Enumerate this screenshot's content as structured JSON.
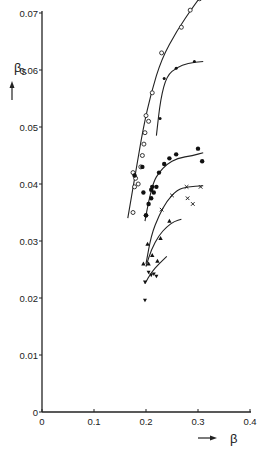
{
  "chart_data": {
    "type": "scatter",
    "title": "",
    "xlabel": "β",
    "ylabel": "βs",
    "xlim": [
      0,
      0.4
    ],
    "ylim": [
      0,
      0.07
    ],
    "x_ticks": [
      "0",
      "0.1",
      "0.2",
      "0.3",
      "0.4"
    ],
    "y_ticks": [
      "0",
      "0.01",
      "0.02",
      "0.03",
      "0.04",
      "0.05",
      "0.06",
      "0.07"
    ],
    "grid": false,
    "legend": "none",
    "series": [
      {
        "name": "open circles",
        "marker": "circle-open",
        "points": [
          [
            0.175,
            0.042
          ],
          [
            0.18,
            0.041
          ],
          [
            0.178,
            0.0395
          ],
          [
            0.185,
            0.04
          ],
          [
            0.19,
            0.043
          ],
          [
            0.193,
            0.045
          ],
          [
            0.196,
            0.047
          ],
          [
            0.198,
            0.049
          ],
          [
            0.2,
            0.052
          ],
          [
            0.205,
            0.051
          ],
          [
            0.212,
            0.056
          ],
          [
            0.23,
            0.063
          ],
          [
            0.268,
            0.0675
          ],
          [
            0.285,
            0.0705
          ],
          [
            0.303,
            0.0725
          ],
          [
            0.175,
            0.035
          ]
        ],
        "curve": [
          [
            0.165,
            0.034
          ],
          [
            0.18,
            0.042
          ],
          [
            0.195,
            0.05
          ],
          [
            0.21,
            0.056
          ],
          [
            0.23,
            0.062
          ],
          [
            0.26,
            0.067
          ],
          [
            0.29,
            0.071
          ],
          [
            0.31,
            0.0735
          ]
        ]
      },
      {
        "name": "small filled (upper)",
        "marker": "dot-small",
        "points": [
          [
            0.227,
            0.0515
          ],
          [
            0.235,
            0.0585
          ],
          [
            0.258,
            0.0603
          ],
          [
            0.293,
            0.0615
          ]
        ],
        "curve": [
          [
            0.22,
            0.0485
          ],
          [
            0.228,
            0.055
          ],
          [
            0.24,
            0.059
          ],
          [
            0.26,
            0.0605
          ],
          [
            0.28,
            0.0612
          ],
          [
            0.31,
            0.0615
          ]
        ]
      },
      {
        "name": "filled circles",
        "marker": "circle-filled",
        "points": [
          [
            0.178,
            0.0415
          ],
          [
            0.193,
            0.043
          ],
          [
            0.195,
            0.0385
          ],
          [
            0.2,
            0.0345
          ],
          [
            0.205,
            0.0365
          ],
          [
            0.21,
            0.0375
          ],
          [
            0.21,
            0.039
          ],
          [
            0.212,
            0.0395
          ],
          [
            0.215,
            0.0385
          ],
          [
            0.22,
            0.0395
          ],
          [
            0.225,
            0.042
          ],
          [
            0.235,
            0.0435
          ],
          [
            0.245,
            0.0445
          ],
          [
            0.258,
            0.0452
          ],
          [
            0.3,
            0.0462
          ],
          [
            0.308,
            0.044
          ],
          [
            0.2,
            0.0345
          ]
        ],
        "curve": [
          [
            0.198,
            0.0335
          ],
          [
            0.205,
            0.037
          ],
          [
            0.215,
            0.0405
          ],
          [
            0.225,
            0.042
          ],
          [
            0.24,
            0.0435
          ],
          [
            0.26,
            0.0445
          ],
          [
            0.29,
            0.045
          ],
          [
            0.31,
            0.0455
          ]
        ]
      },
      {
        "name": "crosses",
        "marker": "cross",
        "points": [
          [
            0.23,
            0.0355
          ],
          [
            0.25,
            0.038
          ],
          [
            0.278,
            0.0395
          ],
          [
            0.28,
            0.0375
          ],
          [
            0.29,
            0.0365
          ],
          [
            0.305,
            0.0395
          ]
        ],
        "curve": [
          [
            0.2,
            0.026
          ],
          [
            0.21,
            0.031
          ],
          [
            0.225,
            0.0345
          ],
          [
            0.24,
            0.037
          ],
          [
            0.26,
            0.039
          ],
          [
            0.28,
            0.0395
          ],
          [
            0.31,
            0.0397
          ]
        ]
      },
      {
        "name": "triangles up",
        "marker": "triangle-up",
        "points": [
          [
            0.195,
            0.026
          ],
          [
            0.203,
            0.0295
          ],
          [
            0.212,
            0.0275
          ],
          [
            0.228,
            0.0305
          ],
          [
            0.245,
            0.0335
          ],
          [
            0.205,
            0.026
          ],
          [
            0.222,
            0.0265
          ]
        ],
        "curve": [
          [
            0.2,
            0.0255
          ],
          [
            0.21,
            0.0285
          ],
          [
            0.225,
            0.031
          ],
          [
            0.24,
            0.0325
          ],
          [
            0.255,
            0.0335
          ],
          [
            0.268,
            0.0338
          ]
        ]
      },
      {
        "name": "triangles down",
        "marker": "triangle-down",
        "points": [
          [
            0.198,
            0.0228
          ],
          [
            0.205,
            0.0245
          ],
          [
            0.21,
            0.024
          ],
          [
            0.215,
            0.0242
          ],
          [
            0.22,
            0.0238
          ],
          [
            0.198,
            0.0196
          ]
        ],
        "curve": [
          [
            0.198,
            0.0225
          ],
          [
            0.21,
            0.0245
          ],
          [
            0.225,
            0.026
          ],
          [
            0.24,
            0.0273
          ]
        ]
      }
    ]
  }
}
